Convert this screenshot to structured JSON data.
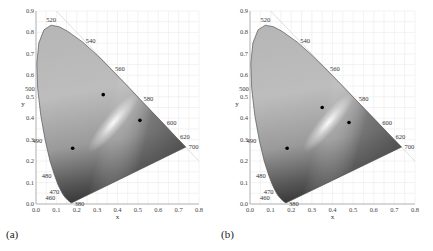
{
  "figure": {
    "panels": [
      {
        "label": "(a)"
      },
      {
        "label": "(b)"
      }
    ]
  },
  "chart_data": [
    {
      "type": "scatter",
      "title": "CIE 1931 chromaticity diagram (a)",
      "panel_label": "(a)",
      "xlabel": "x",
      "ylabel": "y",
      "xlim": [
        0.0,
        0.8
      ],
      "ylim": [
        0.0,
        0.9
      ],
      "x_ticks": [
        "0.0",
        "0.1",
        "0.2",
        "0.3",
        "0.4",
        "0.5",
        "0.6",
        "0.7",
        "0.8"
      ],
      "y_ticks": [
        "0.0",
        "0.1",
        "0.2",
        "0.3",
        "0.4",
        "0.5",
        "0.6",
        "0.7",
        "0.8",
        "0.9"
      ],
      "grid": true,
      "wavelength_labels": [
        "460",
        "470",
        "480",
        "490",
        "500",
        "520",
        "540",
        "560",
        "580",
        "600",
        "620",
        "700",
        "380"
      ],
      "points": [
        {
          "x": 0.33,
          "y": 0.51
        },
        {
          "x": 0.51,
          "y": 0.39
        },
        {
          "x": 0.18,
          "y": 0.26
        }
      ]
    },
    {
      "type": "scatter",
      "title": "CIE 1931 chromaticity diagram (b)",
      "panel_label": "(b)",
      "xlabel": "x",
      "ylabel": "y",
      "xlim": [
        0.0,
        0.8
      ],
      "ylim": [
        0.0,
        0.9
      ],
      "x_ticks": [
        "0.0",
        "0.1",
        "0.2",
        "0.3",
        "0.4",
        "0.5",
        "0.6",
        "0.7",
        "0.8"
      ],
      "y_ticks": [
        "0.0",
        "0.1",
        "0.2",
        "0.3",
        "0.4",
        "0.5",
        "0.6",
        "0.7",
        "0.8",
        "0.9"
      ],
      "grid": true,
      "wavelength_labels": [
        "460",
        "470",
        "480",
        "490",
        "500",
        "520",
        "540",
        "560",
        "580",
        "600",
        "620",
        "700",
        "380"
      ],
      "points": [
        {
          "x": 0.35,
          "y": 0.45
        },
        {
          "x": 0.48,
          "y": 0.38
        },
        {
          "x": 0.18,
          "y": 0.26
        }
      ]
    }
  ]
}
